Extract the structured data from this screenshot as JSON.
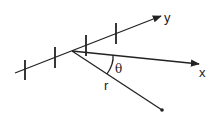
{
  "diagram": {
    "labels": {
      "y_axis": "y",
      "x_axis": "x",
      "radius": "r",
      "angle": "θ"
    },
    "colors": {
      "stroke": "#222222",
      "background": "#ffffff"
    },
    "tick_count": 4
  }
}
